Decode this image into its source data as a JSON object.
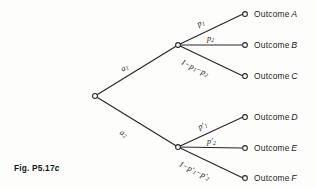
{
  "figure": {
    "caption_prefix": "Fig. P5.17",
    "caption_suffix": "c"
  },
  "diagram": {
    "type": "decision-tree",
    "root_node": {
      "x": 95,
      "y": 96
    },
    "decision_branches": [
      {
        "id": "a1",
        "label_main": "a",
        "label_sub": "1",
        "from": {
          "x": 95,
          "y": 96
        },
        "to": {
          "x": 178,
          "y": 45
        }
      },
      {
        "id": "a2",
        "label_main": "a",
        "label_sub": "2",
        "from": {
          "x": 95,
          "y": 96
        },
        "to": {
          "x": 178,
          "y": 147
        }
      }
    ],
    "chance_nodes": [
      {
        "id": "chance-upper",
        "x": 178,
        "y": 45
      },
      {
        "id": "chance-lower",
        "x": 178,
        "y": 147
      }
    ],
    "outcome_branches": [
      {
        "id": "outcome-a",
        "probability": "p",
        "prob_sub": "1",
        "prob_prime": false,
        "prob_text": "p1",
        "outcome_prefix": "Outcome",
        "outcome_letter": "A",
        "from": {
          "x": 178,
          "y": 45
        },
        "to": {
          "x": 245,
          "y": 14
        }
      },
      {
        "id": "outcome-b",
        "probability": "p",
        "prob_sub": "2",
        "prob_prime": false,
        "prob_text": "p2",
        "outcome_prefix": "Outcome",
        "outcome_letter": "B",
        "from": {
          "x": 178,
          "y": 45
        },
        "to": {
          "x": 245,
          "y": 45
        }
      },
      {
        "id": "outcome-c",
        "probability": "1-p1-p2",
        "prob_sub": "",
        "prob_prime": false,
        "prob_text": "1 - p1 - p2",
        "outcome_prefix": "Outcome",
        "outcome_letter": "C",
        "from": {
          "x": 178,
          "y": 45
        },
        "to": {
          "x": 245,
          "y": 76
        }
      },
      {
        "id": "outcome-d",
        "probability": "p",
        "prob_sub": "1",
        "prob_prime": true,
        "prob_text": "p'1",
        "outcome_prefix": "Outcome",
        "outcome_letter": "D",
        "from": {
          "x": 178,
          "y": 147
        },
        "to": {
          "x": 245,
          "y": 117
        }
      },
      {
        "id": "outcome-e",
        "probability": "p",
        "prob_sub": "2",
        "prob_prime": true,
        "prob_text": "p'2",
        "outcome_prefix": "Outcome",
        "outcome_letter": "E",
        "from": {
          "x": 178,
          "y": 147
        },
        "to": {
          "x": 245,
          "y": 148
        }
      },
      {
        "id": "outcome-f",
        "probability": "1-p'1-p'2",
        "prob_sub": "",
        "prob_prime": true,
        "prob_text": "1 - p'1 - p'2",
        "outcome_prefix": "Outcome",
        "outcome_letter": "F",
        "from": {
          "x": 178,
          "y": 147
        },
        "to": {
          "x": 245,
          "y": 178
        }
      }
    ]
  },
  "colors": {
    "ink": "#26262b",
    "paper": "#fdfdfb"
  }
}
